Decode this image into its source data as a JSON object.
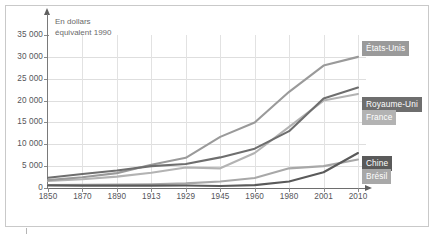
{
  "chart_data": {
    "type": "line",
    "title": "",
    "subtitle": "",
    "annotation": "En dollars\néquivalent 1990",
    "xlabel": "",
    "ylabel": "",
    "ylim": [
      0,
      35000
    ],
    "ytick_labels": [
      "35 000",
      "30 000",
      "25 000",
      "20 000",
      "15 000",
      "10 000",
      "5 000",
      "0"
    ],
    "ytick_values": [
      35000,
      30000,
      25000,
      20000,
      15000,
      10000,
      5000,
      0
    ],
    "grid": true,
    "legend_position": "right",
    "categories": [
      "1850",
      "1870",
      "1890",
      "1913",
      "1929",
      "1945",
      "1960",
      "1980",
      "2001",
      "2010"
    ],
    "x": [
      1850,
      1870,
      1890,
      1913,
      1929,
      1945,
      1960,
      1980,
      2001,
      2010
    ],
    "series": [
      {
        "name": "États-Unis",
        "color": "#9a9a9a",
        "values": [
          1800,
          2450,
          3400,
          5300,
          6900,
          11700,
          15000,
          22000,
          28000,
          30000
        ]
      },
      {
        "name": "Royaume-Uni",
        "color": "#6e6e6e",
        "values": [
          2350,
          3200,
          4000,
          5000,
          5500,
          7000,
          9000,
          13000,
          20500,
          23000
        ]
      },
      {
        "name": "France",
        "color": "#b3b3b3",
        "values": [
          1600,
          2000,
          2600,
          3500,
          4700,
          4500,
          8000,
          14000,
          20000,
          21500
        ]
      },
      {
        "name": "Chine",
        "color": "#5a5a5a",
        "values": [
          600,
          550,
          540,
          550,
          560,
          450,
          650,
          1500,
          3600,
          8000
        ]
      },
      {
        "name": "Brésil",
        "color": "#a8a8a8",
        "values": [
          700,
          750,
          800,
          850,
          1050,
          1500,
          2300,
          4500,
          5000,
          6500
        ]
      }
    ]
  },
  "legend": [
    {
      "label": "États-Unis",
      "badge_color": "#9a9a9a"
    },
    {
      "label": "Royaume-Uni",
      "badge_color": "#6e6e6e"
    },
    {
      "label": "France",
      "badge_color": "#b3b3b3"
    },
    {
      "label": "Chine",
      "badge_color": "#5a5a5a"
    },
    {
      "label": "Brésil",
      "badge_color": "#a8a8a8"
    }
  ]
}
